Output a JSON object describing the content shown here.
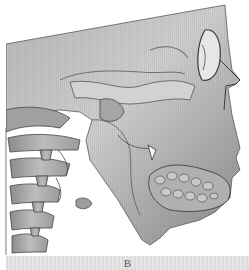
{
  "figure": {
    "panel_label": "B",
    "colors": {
      "background": "#ffffff",
      "bone_light": "#c8c8c8",
      "bone_mid": "#9a9a9a",
      "bone_dark": "#4a4a4a",
      "label_bar": "#e0e0e0",
      "label_text": "#555555"
    }
  }
}
